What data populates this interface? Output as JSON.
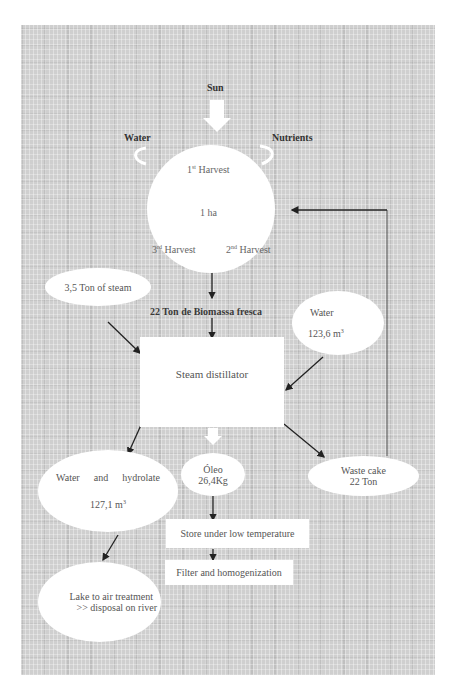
{
  "diagram": {
    "inputs": {
      "sun": "Sun",
      "water": "Water",
      "nutrients": "Nutrients"
    },
    "field": {
      "area": "1 ha",
      "harvests": [
        {
          "num": "1",
          "sup": "st",
          "label": "Harvest"
        },
        {
          "num": "2",
          "sup": "nd",
          "label": "Harvest"
        },
        {
          "num": "3",
          "sup": "rd",
          "label": "Harvest"
        }
      ]
    },
    "biomass_label": "22 Ton de Biomassa fresca",
    "steam_input": "3,5 Ton of steam",
    "water_input": {
      "label": "Water",
      "value": "123,6 m",
      "unit_sup": "3"
    },
    "distillator": "Steam distillator",
    "outputs": {
      "hydrolate": {
        "label_a": "Water",
        "label_b": "and",
        "label_c": "hydrolate",
        "value": "127,1 m",
        "unit_sup": "3"
      },
      "oil": {
        "label": "Óleo",
        "value": "26,4Kg"
      },
      "waste": {
        "label": "Waste cake",
        "value": "22 Ton"
      }
    },
    "oil_steps": [
      "Store under low temperature",
      "Filter and homogenization"
    ],
    "hydrolate_destination": {
      "line1": "Lake to air treatment",
      "line2": ">> disposal on river"
    }
  },
  "colors": {
    "panel": "#cfcfcf",
    "node_fill": "#ffffff",
    "arrow": "#222222"
  }
}
